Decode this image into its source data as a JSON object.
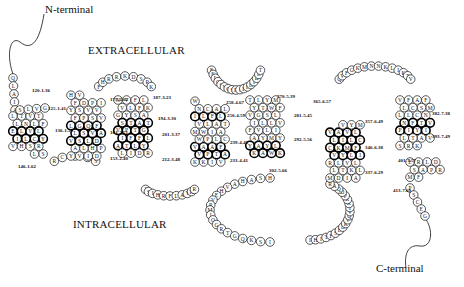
{
  "figure": {
    "type": "GPCR snake plot (7-transmembrane receptor topology)",
    "labels": {
      "n_terminal": "N-terminal",
      "c_terminal": "C-terminal",
      "extracellular": "EXTRACELLULAR",
      "intracellular": "INTRACELLULAR"
    },
    "position_labels": [
      {
        "text": "120-1.36",
        "x": 32,
        "y": 88
      },
      {
        "text": "125-1.41",
        "x": 48,
        "y": 106
      },
      {
        "text": "136-1.52",
        "x": 55,
        "y": 128
      },
      {
        "text": "146-1.62",
        "x": 18,
        "y": 164
      },
      {
        "text": "175-2.62",
        "x": 110,
        "y": 97
      },
      {
        "text": "164-2.51",
        "x": 110,
        "y": 130
      },
      {
        "text": "153-2.40",
        "x": 110,
        "y": 156
      },
      {
        "text": "187-3.23",
        "x": 153,
        "y": 95
      },
      {
        "text": "194-3.30",
        "x": 158,
        "y": 116
      },
      {
        "text": "201-3.37",
        "x": 162,
        "y": 132
      },
      {
        "text": "212-3.48",
        "x": 162,
        "y": 157
      },
      {
        "text": "258-4.67",
        "x": 226,
        "y": 100
      },
      {
        "text": "250-4.59",
        "x": 227,
        "y": 113
      },
      {
        "text": "239-4.48",
        "x": 230,
        "y": 140
      },
      {
        "text": "233-4.41",
        "x": 230,
        "y": 158
      },
      {
        "text": "270-5.39",
        "x": 277,
        "y": 94
      },
      {
        "text": "281-5.45",
        "x": 294,
        "y": 113
      },
      {
        "text": "292-5.56",
        "x": 294,
        "y": 137
      },
      {
        "text": "302-5.66",
        "x": 269,
        "y": 168
      },
      {
        "text": "365-6.57",
        "x": 313,
        "y": 99
      },
      {
        "text": "357-6.49",
        "x": 365,
        "y": 119
      },
      {
        "text": "346-6.38",
        "x": 365,
        "y": 145
      },
      {
        "text": "337-6.29",
        "x": 365,
        "y": 170
      },
      {
        "text": "382-7.38",
        "x": 432,
        "y": 111
      },
      {
        "text": "393-7.49",
        "x": 432,
        "y": 134
      },
      {
        "text": "401-7.57",
        "x": 398,
        "y": 158
      },
      {
        "text": "413-7.69",
        "x": 393,
        "y": 188
      }
    ],
    "segments": {
      "n_term_tail": [
        "Q",
        "L",
        "A",
        "I",
        "A"
      ],
      "tm1": [
        "S",
        "L",
        "V",
        "G",
        "L",
        "T",
        "V",
        "T",
        "F",
        "L",
        "N",
        "L",
        "E",
        "L",
        "V",
        "L",
        "Y",
        "C",
        "L",
        "I",
        "V",
        "H",
        "S",
        "R",
        "S",
        "L"
      ],
      "icl1": [
        "R",
        "C",
        "R",
        "P",
        "S"
      ],
      "tm2": [
        "Y",
        "V",
        "I",
        "D",
        "P",
        "H",
        "L",
        "A",
        "V",
        "S",
        "L",
        "D",
        "A",
        "V",
        "S",
        "L",
        "L",
        "G",
        "Q",
        "F",
        "V",
        "S",
        "P",
        "F",
        "Y",
        "S",
        "V",
        "V",
        "I",
        "P",
        "D",
        "F",
        "H",
        "V"
      ],
      "ecl1": [
        "F",
        "H",
        "R",
        "R",
        "K",
        "D",
        "S",
        "R",
        "K"
      ],
      "tm3": [
        "N",
        "V",
        "F",
        "L",
        "K",
        "F",
        "L",
        "V",
        "G",
        "Y",
        "S",
        "A",
        "T",
        "A",
        "T",
        "S",
        "V",
        "P",
        "T",
        "G",
        "L",
        "F",
        "F",
        "I",
        "A",
        "T",
        "L",
        "Y",
        "R",
        "D",
        "I",
        "L"
      ],
      "icl2": [
        "I",
        "S",
        "I",
        "H",
        "R",
        "F",
        "L",
        "A",
        "Y",
        "K",
        "R"
      ],
      "tm4": [
        "K",
        "K",
        "I",
        "V",
        "A",
        "T",
        "P",
        "V",
        "V",
        "A",
        "A",
        "F",
        "C",
        "L",
        "P",
        "W",
        "M",
        "W",
        "I",
        "A",
        "T",
        "A",
        "L",
        "V",
        "I",
        "L",
        "F",
        "L",
        "L",
        "A",
        "C",
        "N",
        "W"
      ],
      "ecl2": [
        "E",
        "K",
        "L",
        "Q",
        "S",
        "V",
        "C",
        "S",
        "D",
        "I",
        "F",
        "F",
        "H",
        "I",
        "D",
        "E",
        "T"
      ],
      "tm5": [
        "T",
        "L",
        "Y",
        "M",
        "F",
        "W",
        "T",
        "Y",
        "V",
        "G",
        "S",
        "L",
        "V",
        "L",
        "L",
        "I",
        "F",
        "V",
        "L",
        "I",
        "Y",
        "M",
        "Y",
        "A",
        "Y",
        "A",
        "Y",
        "L",
        "K",
        "W",
        "A",
        "K"
      ],
      "icl3": [
        "H",
        "S",
        "A",
        "H",
        "A",
        "V",
        "H",
        "E",
        "V",
        "R",
        "M",
        "I",
        "Q",
        "G",
        "R",
        "T",
        "G",
        "Q",
        "K",
        "S",
        "I",
        "I",
        "H",
        "I",
        "T",
        "F",
        "S",
        "E",
        "D",
        "K",
        "V",
        "Q",
        "V",
        "T",
        "K",
        "R",
        "P",
        "D",
        "Q",
        "A",
        "R"
      ],
      "tm6": [
        "M",
        "D",
        "I",
        "A",
        "L",
        "K",
        "T",
        "L",
        "R",
        "L",
        "V",
        "L",
        "I",
        "L",
        "Y",
        "V",
        "C",
        "K",
        "M",
        "F",
        "C",
        "L",
        "I",
        "L",
        "V",
        "A",
        "V",
        "L",
        "M",
        "Y",
        "V"
      ],
      "ecl3": [
        "Q",
        "V",
        "F",
        "G",
        "K",
        "M",
        "N",
        "N",
        "K",
        "L",
        "I",
        "K",
        "T",
        "V"
      ],
      "tm7": [
        "V",
        "F",
        "A",
        "F",
        "M",
        "S",
        "C",
        "L",
        "L",
        "L",
        "C",
        "N",
        "V",
        "T",
        "F",
        "N",
        "P",
        "I",
        "Y",
        "I",
        "V",
        "A",
        "T",
        "L",
        "S",
        "R",
        "K"
      ],
      "helix8": [
        "E",
        "R",
        "L",
        "D",
        "R",
        "P",
        "A",
        "S",
        "M",
        "F"
      ],
      "c_term_tail": [
        "P",
        "S",
        "C",
        "E",
        "G"
      ]
    },
    "colors": {
      "outline": "#111111",
      "thick_outline": "#000000",
      "background": "#ffffff"
    }
  }
}
